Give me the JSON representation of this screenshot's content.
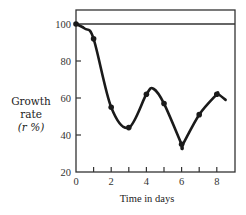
{
  "chart_data": {
    "type": "line",
    "title": "",
    "xlabel": "Time in days",
    "ylabel": "Growth rate (r %)",
    "ylabel_lines": [
      "Growth",
      "rate",
      "(r %)"
    ],
    "x": [
      0,
      1,
      2,
      3,
      4,
      5,
      6,
      7,
      8
    ],
    "values": [
      100,
      92,
      55,
      44,
      62,
      57,
      35,
      51,
      62
    ],
    "curve_end": {
      "x": 8.5,
      "y": 59
    },
    "xlim": [
      0,
      9
    ],
    "ylim": [
      20,
      106
    ],
    "xticks": [
      0,
      1,
      2,
      3,
      4,
      5,
      6,
      7,
      8
    ],
    "xtick_labels": [
      "0",
      "2",
      "4",
      "6",
      "8"
    ],
    "yticks": [
      20,
      40,
      60,
      80,
      100
    ],
    "ytick_labels": [
      "20",
      "40",
      "60",
      "80",
      "100"
    ],
    "reference_line": {
      "y": 100
    },
    "grid": false,
    "legend": null,
    "markers": true,
    "line_color": "#1a1a1a"
  }
}
